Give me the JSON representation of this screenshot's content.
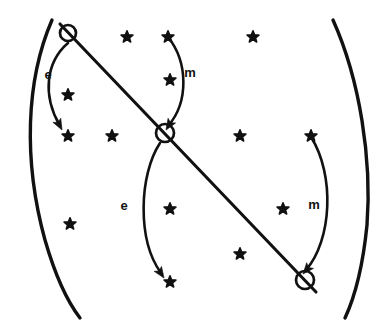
{
  "figure": {
    "width": 390,
    "height": 329,
    "background_color": "#ffffff",
    "ink_color": "#111111"
  },
  "labels": [
    {
      "text": "e",
      "x": 48,
      "y": 74,
      "name": "label-e-upper-left"
    },
    {
      "text": "m",
      "x": 190,
      "y": 72,
      "name": "label-m-upper-right"
    },
    {
      "text": "e",
      "x": 124,
      "y": 205,
      "name": "label-e-lower-left"
    },
    {
      "text": "m",
      "x": 314,
      "y": 204,
      "name": "label-m-lower-right"
    }
  ],
  "nodes": [
    {
      "name": "node-top-left",
      "x": 68,
      "y": 33,
      "r": 8
    },
    {
      "name": "node-center",
      "x": 165,
      "y": 133,
      "r": 9
    },
    {
      "name": "node-bottom-right",
      "x": 305,
      "y": 280,
      "r": 9
    }
  ],
  "main_line": {
    "name": "main-diagonal-line",
    "x1": 60,
    "y1": 24,
    "x2": 316,
    "y2": 292
  },
  "boundary_arcs": [
    {
      "name": "boundary-arc-left",
      "d": "M 52 20 C 26 80 23 160 45 240 C 58 285 70 305 80 318"
    },
    {
      "name": "boundary-arc-right",
      "d": "M 333 20 C 360 80 372 160 367 225 C 362 275 352 303 345 318"
    }
  ],
  "curved_arrows": [
    {
      "name": "arrow-e-upper",
      "label": "e",
      "d": "M 68 43 C 46 62 42 95 60 126",
      "head": {
        "x": 62,
        "y": 130,
        "angle": 62
      }
    },
    {
      "name": "arrow-m-upper",
      "label": "m",
      "d": "M 168 37 C 188 62 189 102 168 126",
      "head": {
        "x": 166,
        "y": 130,
        "angle": 122
      }
    },
    {
      "name": "arrow-e-lower",
      "label": "e",
      "d": "M 160 143 C 139 175 137 240 161 273",
      "head": {
        "x": 164,
        "y": 278,
        "angle": 56
      }
    },
    {
      "name": "arrow-m-lower",
      "label": "m",
      "d": "M 311 137 C 335 175 332 240 306 270",
      "head": {
        "x": 303,
        "y": 274,
        "angle": 130
      }
    }
  ],
  "stars": [
    {
      "x": 127,
      "y": 37
    },
    {
      "x": 168,
      "y": 37
    },
    {
      "x": 253,
      "y": 37
    },
    {
      "x": 170,
      "y": 80
    },
    {
      "x": 68,
      "y": 95
    },
    {
      "x": 68,
      "y": 136
    },
    {
      "x": 112,
      "y": 136
    },
    {
      "x": 240,
      "y": 136
    },
    {
      "x": 311,
      "y": 136
    },
    {
      "x": 170,
      "y": 209
    },
    {
      "x": 283,
      "y": 209
    },
    {
      "x": 70,
      "y": 224
    },
    {
      "x": 240,
      "y": 254
    },
    {
      "x": 170,
      "y": 282
    }
  ]
}
